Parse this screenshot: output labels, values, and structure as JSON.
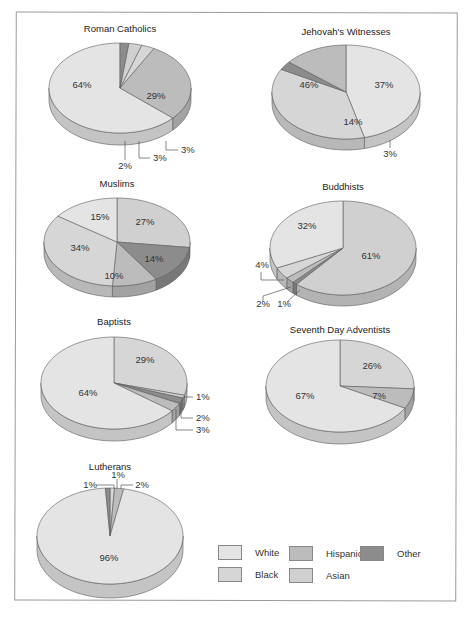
{
  "figure": {
    "caption": "Figure 3.3"
  },
  "colors": {
    "White": "#e4e4e4",
    "Black": "#d6d6d6",
    "Hispanic": "#bcbcbc",
    "Asian": "#d0d0d0",
    "Other": "#8c8c8c",
    "outline": "#5a5a5a"
  },
  "legend": {
    "items": [
      {
        "label": "White",
        "color": "#e4e4e4"
      },
      {
        "label": "Hispanic",
        "color": "#bcbcbc"
      },
      {
        "label": "Other",
        "color": "#8c8c8c"
      },
      {
        "label": "Black",
        "color": "#d6d6d6"
      },
      {
        "label": "Asian",
        "color": "#d0d0d0"
      }
    ]
  },
  "chart_data": [
    {
      "type": "pie",
      "title": "Roman Catholics",
      "slices": [
        {
          "category": "White",
          "value": 64,
          "label": "64%"
        },
        {
          "category": "Hispanic",
          "value": 29,
          "label": "29%"
        },
        {
          "category": "Black",
          "value": 3,
          "label": "3%"
        },
        {
          "category": "Asian",
          "value": 3,
          "label": "3%"
        },
        {
          "category": "Other",
          "value": 2,
          "label": "2%"
        }
      ]
    },
    {
      "type": "pie",
      "title": "Jehovah's Witnesses",
      "slices": [
        {
          "category": "White",
          "value": 46,
          "label": "46%"
        },
        {
          "category": "Black",
          "value": 37,
          "label": "37%"
        },
        {
          "category": "Other",
          "value": 3,
          "label": "3%"
        },
        {
          "category": "Hispanic",
          "value": 14,
          "label": "14%"
        }
      ]
    },
    {
      "type": "pie",
      "title": "Muslims",
      "slices": [
        {
          "category": "Asian",
          "value": 27,
          "label": "27%"
        },
        {
          "category": "Other",
          "value": 14,
          "label": "14%"
        },
        {
          "category": "Hispanic",
          "value": 10,
          "label": "10%"
        },
        {
          "category": "Black",
          "value": 34,
          "label": "34%"
        },
        {
          "category": "White",
          "value": 15,
          "label": "15%"
        }
      ]
    },
    {
      "type": "pie",
      "title": "Buddhists",
      "slices": [
        {
          "category": "Asian",
          "value": 61,
          "label": "61%"
        },
        {
          "category": "Other",
          "value": 1,
          "label": "1%"
        },
        {
          "category": "Hispanic",
          "value": 2,
          "label": "2%"
        },
        {
          "category": "Black",
          "value": 4,
          "label": "4%"
        },
        {
          "category": "White",
          "value": 32,
          "label": "32%"
        }
      ]
    },
    {
      "type": "pie",
      "title": "Baptists",
      "slices": [
        {
          "category": "Black",
          "value": 29,
          "label": "29%"
        },
        {
          "category": "Asian",
          "value": 1,
          "label": "1%"
        },
        {
          "category": "Other",
          "value": 2,
          "label": "2%"
        },
        {
          "category": "Hispanic",
          "value": 3,
          "label": "3%"
        },
        {
          "category": "White",
          "value": 64,
          "label": "64%"
        }
      ]
    },
    {
      "type": "pie",
      "title": "Seventh Day Adventists",
      "slices": [
        {
          "category": "Black",
          "value": 26,
          "label": "26%"
        },
        {
          "category": "Hispanic",
          "value": 7,
          "label": "7%"
        },
        {
          "category": "White",
          "value": 67,
          "label": "67%"
        }
      ]
    },
    {
      "type": "pie",
      "title": "Lutherans",
      "slices": [
        {
          "category": "Black",
          "value": 1,
          "label": "1%"
        },
        {
          "category": "Hispanic",
          "value": 2,
          "label": "2%"
        },
        {
          "category": "White",
          "value": 96,
          "label": "96%"
        },
        {
          "category": "Other",
          "value": 1,
          "label": "1%"
        }
      ]
    }
  ]
}
